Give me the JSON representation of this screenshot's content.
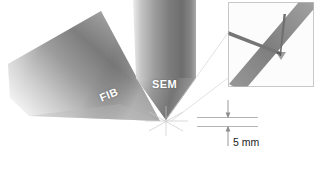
{
  "figure": {
    "background_color": "#ffffff"
  },
  "columns": [
    {
      "id": "fib",
      "label": "FIB",
      "description": "Focused ion beam column, tilted cone",
      "label_color": "#ffffff",
      "fill_light": "#e9e9e9",
      "fill_dark": "#6f6f6f"
    },
    {
      "id": "sem",
      "label": "SEM",
      "description": "Scanning electron microscope column, vertical cone",
      "label_color": "#ffffff",
      "fill_light": "#dcdcdc",
      "fill_dark": "#6b6b6b"
    }
  ],
  "scale": {
    "value": "5 mm",
    "description": "Working distance dimension between sample surface and stage plane",
    "arrow_color": "#8d8d8d",
    "line_color": "#b4b4b4"
  },
  "inset": {
    "description": "Magnified photograph of the beam coincidence point showing needle probes and sample bar",
    "border_color": "#c8c8c8",
    "background_color": "#fcfcfc",
    "bar_color": "#8c8c8c",
    "needle_color": "#6a6a6a"
  },
  "leader_lines": {
    "description": "Faint lines linking the beam coincidence point to the inset view",
    "color": "#d0d0d0"
  },
  "crosshair": {
    "description": "Beam coincidence point where FIB and SEM axes intersect",
    "color": "#c9c9c9"
  }
}
